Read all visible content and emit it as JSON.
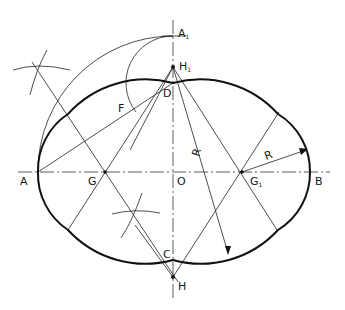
{
  "labels": {
    "A": "A",
    "B": "B",
    "O": "O",
    "C": "C",
    "D": "D",
    "F": "F",
    "G": "G",
    "G1": "G",
    "G1_sub": "1",
    "H": "H",
    "H1": "H",
    "H1_sub": "1",
    "A1": "A",
    "A1_sub": "1",
    "R_small": "R",
    "R_large": "R"
  },
  "points": {
    "A": [
      38,
      172
    ],
    "B": [
      310,
      172
    ],
    "O": [
      173,
      172
    ],
    "C": [
      173,
      260
    ],
    "D": [
      173,
      83
    ],
    "G": [
      105,
      172
    ],
    "G1": [
      242,
      172
    ],
    "H": [
      173,
      277
    ],
    "H1": [
      173,
      67
    ],
    "A1": [
      173,
      36
    ]
  },
  "colors": {
    "line": "#222222",
    "outline": "#111111",
    "background": "#ffffff"
  }
}
